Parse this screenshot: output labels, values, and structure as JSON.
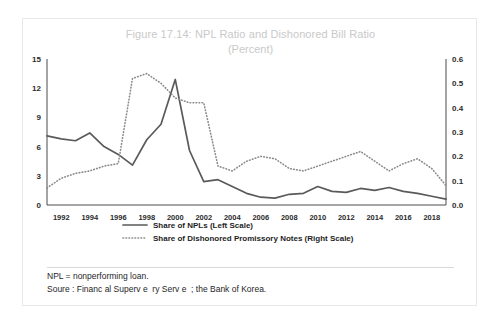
{
  "figure": {
    "title": "Figure 17.14: NPL Ratio and Dishonored Bill Ratio",
    "subtitle": "(Percent)",
    "notes": [
      "NPL = nonperforming loan.",
      "Soure : Financ al Superv e  ry Serv e  ; the Bank of Korea."
    ],
    "colors": {
      "title": "#c9c9c9",
      "series_npl": "#5a5a5a",
      "series_dishonored": "#8a8a8a",
      "axis": "#4a4a4a",
      "card_border": "#e8e8e8"
    }
  },
  "chart_data": {
    "type": "line",
    "title": "Figure 17.14: NPL Ratio and Dishonored Bill Ratio",
    "subtitle": "(Percent)",
    "xlabel": "",
    "ylabel": "",
    "grid": false,
    "legend_position": "bottom",
    "x": [
      1991,
      1992,
      1993,
      1994,
      1995,
      1996,
      1997,
      1998,
      1999,
      2000,
      2001,
      2002,
      2003,
      2004,
      2005,
      2006,
      2007,
      2008,
      2009,
      2010,
      2011,
      2012,
      2013,
      2014,
      2015,
      2016,
      2017,
      2018,
      2019
    ],
    "x_tick_labels": [
      "1992",
      "1994",
      "1996",
      "1998",
      "2000",
      "2002",
      "2004",
      "2006",
      "2008",
      "2010",
      "2012",
      "2014",
      "2016",
      "2018"
    ],
    "left_axis": {
      "label": "Share of NPLs (Left Scale)",
      "ticks": [
        "0",
        "3",
        "6",
        "9",
        "12",
        "15"
      ],
      "ylim": [
        0,
        15
      ]
    },
    "right_axis": {
      "label": "Share of Dishonored Promissory Notes (Right Scale)",
      "ticks": [
        "0.0",
        "0.1",
        "0.2",
        "0.3",
        "0.4",
        "0.5",
        "0.6"
      ],
      "ylim": [
        0,
        0.6
      ]
    },
    "series": [
      {
        "name": "Share of NPLs (Left Scale)",
        "axis": "left",
        "style": "solid",
        "color": "#5a5a5a",
        "values": [
          7.1,
          6.8,
          6.6,
          7.4,
          6.0,
          5.2,
          4.1,
          6.7,
          8.3,
          12.9,
          5.6,
          2.4,
          2.6,
          1.9,
          1.2,
          0.8,
          0.7,
          1.1,
          1.2,
          1.9,
          1.4,
          1.3,
          1.7,
          1.5,
          1.8,
          1.4,
          1.2,
          0.9,
          0.6
        ]
      },
      {
        "name": "Share of Dishonored Promissory Notes (Right Scale)",
        "axis": "right",
        "style": "dotted",
        "color": "#8a8a8a",
        "values": [
          0.07,
          0.11,
          0.13,
          0.14,
          0.16,
          0.17,
          0.52,
          0.54,
          0.5,
          0.44,
          0.42,
          0.42,
          0.16,
          0.14,
          0.18,
          0.2,
          0.19,
          0.15,
          0.14,
          0.16,
          0.18,
          0.2,
          0.22,
          0.18,
          0.14,
          0.17,
          0.19,
          0.15,
          0.08
        ]
      }
    ],
    "legend": [
      {
        "label": "Share of NPLs (Left Scale)",
        "style": "solid"
      },
      {
        "label": "Share of Dishonored Promissory Notes (Right Scale)",
        "style": "dotted"
      }
    ]
  }
}
